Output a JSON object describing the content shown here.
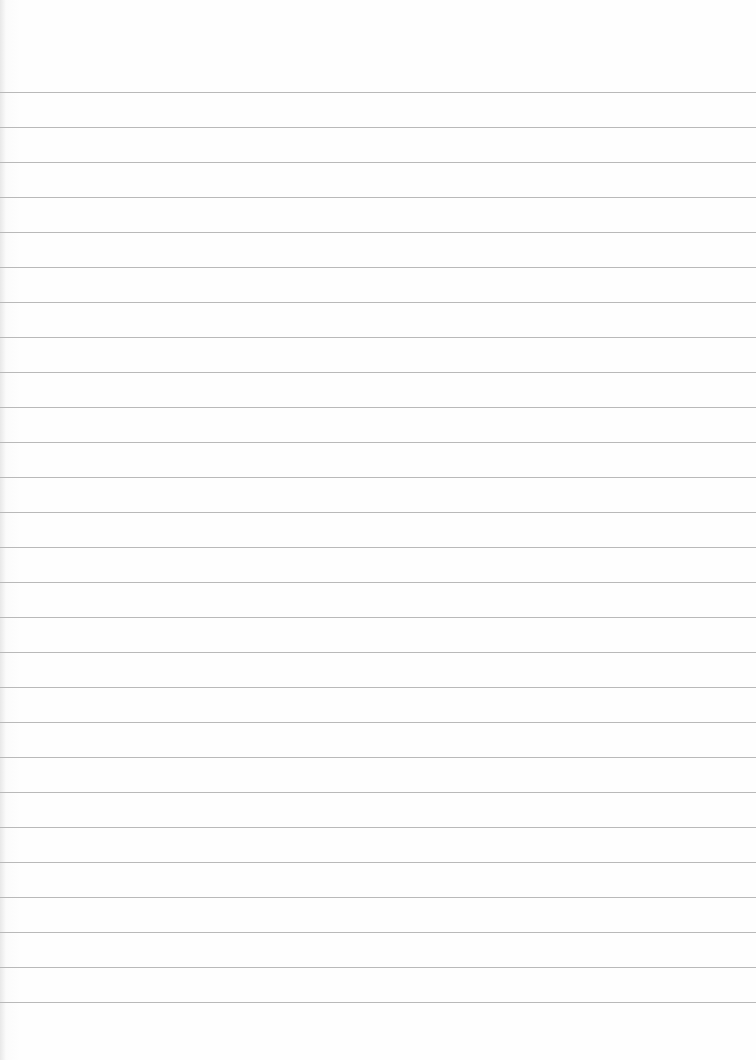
{
  "page": {
    "type": "lined-paper",
    "background_color": "#fefefe",
    "rule_color": "#b9b9b9",
    "first_rule_y": 92,
    "rule_spacing": 35,
    "rule_count": 27
  }
}
